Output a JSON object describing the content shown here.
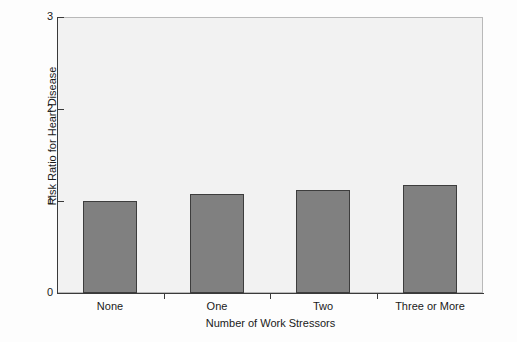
{
  "chart_data": {
    "type": "bar",
    "title": "",
    "xlabel": "Number of Work Stressors",
    "ylabel": "Risk Ratio for Heart Disease",
    "categories": [
      "None",
      "One",
      "Two",
      "Three or More"
    ],
    "values": [
      1.0,
      1.08,
      1.12,
      1.17
    ],
    "ylim": [
      0,
      3
    ],
    "ytick_labels": [
      "0",
      "1",
      "2",
      "3"
    ],
    "ytick_values": [
      0,
      1,
      2,
      3
    ],
    "grid": false,
    "legend": false,
    "legend_position": "none",
    "series": [
      {
        "name": "Risk Ratio for Heart Disease",
        "values": [
          1.0,
          1.08,
          1.12,
          1.17
        ]
      }
    ],
    "bar_fill_color": "#808080",
    "bar_edge_color": "#3d3d3d",
    "plot_background_color": "#f2f2f2",
    "figure_background_color": "#fdfdfd",
    "axis_color": "#3a3a3a"
  }
}
